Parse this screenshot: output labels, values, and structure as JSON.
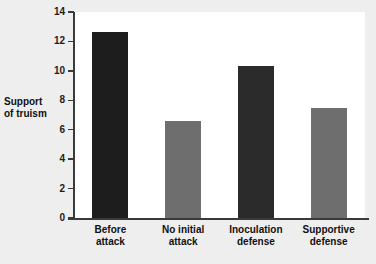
{
  "chart_data": {
    "type": "bar",
    "title": "",
    "xlabel": "",
    "ylabel": "Support of truism",
    "ylabel_line1": "Support",
    "ylabel_line2": "of truism",
    "categories": [
      "Before attack",
      "No initial attack",
      "Inoculation defense",
      "Supportive defense"
    ],
    "category_lines": [
      [
        "Before",
        "attack"
      ],
      [
        "No initial",
        "attack"
      ],
      [
        "Inoculation",
        "defense"
      ],
      [
        "Supportive",
        "defense"
      ]
    ],
    "values": [
      12.65,
      6.6,
      10.3,
      7.5
    ],
    "bar_colors": [
      "#1d1d1d",
      "#6e6e6e",
      "#2b2b2b",
      "#6e6e6e"
    ],
    "ylim": [
      0,
      14
    ],
    "yticks": [
      0,
      2,
      4,
      6,
      8,
      10,
      12,
      14
    ],
    "ytick_labels": [
      "0",
      "2",
      "4",
      "6",
      "8",
      "10",
      "12",
      "14"
    ],
    "grid": false,
    "legend": "none"
  },
  "figure": {
    "background_color": "#eeeeee",
    "plot_background_color": "#ffffff",
    "axis_color": "#3a3a3a"
  }
}
